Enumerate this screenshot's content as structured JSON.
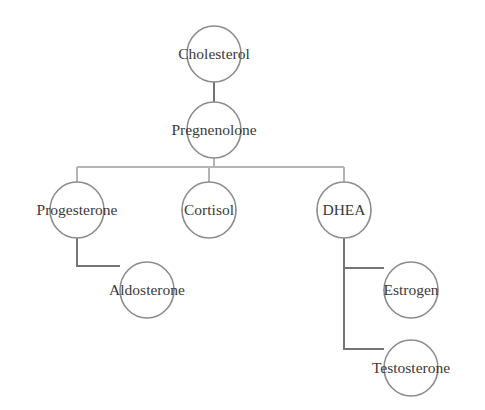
{
  "diagram": {
    "type": "flow-tree",
    "background_color": "#ffffff",
    "node_outline_color": "#8d8d8d",
    "edge_color": "#757575",
    "edge_color_light": "#b4b4b4",
    "label_color": "#3a3a3a",
    "nodes": [
      {
        "id": "cholesterol",
        "label": "Cholesterol",
        "cx": 214,
        "cy": 54,
        "rx": 27,
        "ry": 28
      },
      {
        "id": "pregnenolone",
        "label": "Pregnenolone",
        "cx": 214,
        "cy": 130,
        "rx": 27,
        "ry": 28
      },
      {
        "id": "progesterone",
        "label": "Progesterone",
        "cx": 77,
        "cy": 210,
        "rx": 27,
        "ry": 28
      },
      {
        "id": "cortisol",
        "label": "Cortisol",
        "cx": 209,
        "cy": 210,
        "rx": 27,
        "ry": 28
      },
      {
        "id": "dhea",
        "label": "DHEA",
        "cx": 344,
        "cy": 210,
        "rx": 27,
        "ry": 28
      },
      {
        "id": "aldosterone",
        "label": "Aldosterone",
        "cx": 147,
        "cy": 290,
        "rx": 27,
        "ry": 28
      },
      {
        "id": "estrogen",
        "label": "Estrogen",
        "cx": 411,
        "cy": 290,
        "rx": 27,
        "ry": 28
      },
      {
        "id": "testosterone",
        "label": "Testosterone",
        "cx": 411,
        "cy": 368,
        "rx": 27,
        "ry": 28
      }
    ],
    "edges": [
      {
        "id": "cholesterol-to-pregnenolone",
        "from": "cholesterol",
        "to": "pregnenolone"
      },
      {
        "id": "pregnenolone-to-progesterone",
        "from": "pregnenolone",
        "to": "progesterone"
      },
      {
        "id": "pregnenolone-to-cortisol",
        "from": "pregnenolone",
        "to": "cortisol"
      },
      {
        "id": "pregnenolone-to-dhea",
        "from": "pregnenolone",
        "to": "dhea"
      },
      {
        "id": "progesterone-to-aldosterone",
        "from": "progesterone",
        "to": "aldosterone"
      },
      {
        "id": "dhea-to-estrogen",
        "from": "dhea",
        "to": "estrogen"
      },
      {
        "id": "dhea-to-testosterone",
        "from": "dhea",
        "to": "testosterone"
      }
    ]
  }
}
